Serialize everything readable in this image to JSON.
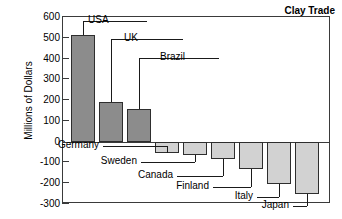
{
  "chart_data": {
    "type": "bar",
    "title": "Clay Trade",
    "xlabel": "",
    "ylabel": "Millions of Dollars",
    "ylim": [
      -300,
      600
    ],
    "yticks": [
      600,
      500,
      400,
      300,
      200,
      100,
      0,
      -100,
      -200,
      -300
    ],
    "ytick_labels": [
      "600",
      "500",
      "400",
      "300",
      "200",
      "100",
      "0",
      "-100",
      "-200",
      "-300"
    ],
    "grid": false,
    "legend": "none",
    "categories": [
      "USA",
      "UK",
      "Brazil",
      "Germany",
      "Sweden",
      "Canada",
      "Finland",
      "Italy",
      "Japan"
    ],
    "values": [
      515,
      190,
      155,
      -55,
      -65,
      -85,
      -133,
      -205,
      -250
    ],
    "series": [
      {
        "name": "Net clay trade",
        "values": [
          515,
          190,
          155,
          -55,
          -65,
          -85,
          -133,
          -205,
          -250
        ]
      }
    ],
    "colors": {
      "positive_bar": "#8c8c8c",
      "negative_bar": "#d2d2d2",
      "bar_edge": "#2e2e2e",
      "axis": "#3a3a3a",
      "text": "#000000",
      "background": "#ffffff"
    },
    "annotations": [
      {
        "label": "USA",
        "value": 515,
        "side": "right"
      },
      {
        "label": "UK",
        "value": 190,
        "side": "right"
      },
      {
        "label": "Brazil",
        "value": 155,
        "side": "right"
      },
      {
        "label": "Germany",
        "value": -55,
        "side": "left"
      },
      {
        "label": "Sweden",
        "value": -65,
        "side": "left"
      },
      {
        "label": "Canada",
        "value": -85,
        "side": "left"
      },
      {
        "label": "Finland",
        "value": -133,
        "side": "left"
      },
      {
        "label": "Italy",
        "value": -205,
        "side": "left"
      },
      {
        "label": "Japan",
        "value": -250,
        "side": "left"
      }
    ]
  }
}
